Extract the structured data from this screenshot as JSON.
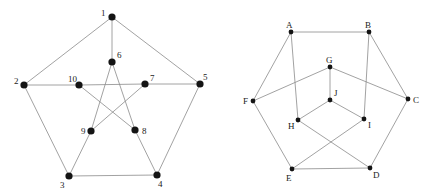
{
  "graphs": [
    {
      "name": "numbered-graph",
      "node_radius": 3.6,
      "nodes": [
        {
          "id": "1",
          "x": 112,
          "y": 17,
          "lx": 101,
          "ly": 16
        },
        {
          "id": "2",
          "x": 24,
          "y": 85,
          "lx": 14,
          "ly": 84
        },
        {
          "id": "3",
          "x": 69,
          "y": 176,
          "lx": 60,
          "ly": 188
        },
        {
          "id": "4",
          "x": 157,
          "y": 175,
          "lx": 158,
          "ly": 187
        },
        {
          "id": "5",
          "x": 200,
          "y": 84,
          "lx": 203,
          "ly": 80
        },
        {
          "id": "6",
          "x": 112,
          "y": 62,
          "lx": 117,
          "ly": 58
        },
        {
          "id": "7",
          "x": 145,
          "y": 84,
          "lx": 150,
          "ly": 81
        },
        {
          "id": "8",
          "x": 135,
          "y": 130,
          "lx": 142,
          "ly": 134
        },
        {
          "id": "9",
          "x": 91,
          "y": 131,
          "lx": 81,
          "ly": 134
        },
        {
          "id": "10",
          "x": 79,
          "y": 85,
          "lx": 68,
          "ly": 82
        }
      ],
      "edges": [
        [
          "1",
          "2"
        ],
        [
          "1",
          "5"
        ],
        [
          "1",
          "6"
        ],
        [
          "2",
          "10"
        ],
        [
          "10",
          "7"
        ],
        [
          "7",
          "5"
        ],
        [
          "2",
          "3"
        ],
        [
          "3",
          "4"
        ],
        [
          "4",
          "5"
        ],
        [
          "6",
          "9"
        ],
        [
          "6",
          "8"
        ],
        [
          "8",
          "4"
        ],
        [
          "9",
          "3"
        ],
        [
          "10",
          "8"
        ],
        [
          "7",
          "9"
        ]
      ]
    },
    {
      "name": "lettered-graph",
      "node_radius": 2.4,
      "nodes": [
        {
          "id": "A",
          "x": 291,
          "y": 32,
          "lx": 286,
          "ly": 28
        },
        {
          "id": "B",
          "x": 369,
          "y": 32,
          "lx": 365,
          "ly": 28
        },
        {
          "id": "C",
          "x": 408,
          "y": 99,
          "lx": 413,
          "ly": 103
        },
        {
          "id": "D",
          "x": 370,
          "y": 168,
          "lx": 373,
          "ly": 178
        },
        {
          "id": "E",
          "x": 292,
          "y": 169,
          "lx": 286,
          "ly": 181
        },
        {
          "id": "F",
          "x": 253,
          "y": 101,
          "lx": 243,
          "ly": 104
        },
        {
          "id": "G",
          "x": 330,
          "y": 67,
          "lx": 326,
          "ly": 63
        },
        {
          "id": "H",
          "x": 298,
          "y": 120,
          "lx": 288,
          "ly": 129
        },
        {
          "id": "I",
          "x": 364,
          "y": 119,
          "lx": 368,
          "ly": 128
        },
        {
          "id": "J",
          "x": 330,
          "y": 100,
          "lx": 334,
          "ly": 96
        }
      ],
      "edges": [
        [
          "A",
          "B"
        ],
        [
          "A",
          "F"
        ],
        [
          "A",
          "H"
        ],
        [
          "B",
          "C"
        ],
        [
          "B",
          "I"
        ],
        [
          "G",
          "F"
        ],
        [
          "G",
          "C"
        ],
        [
          "G",
          "J"
        ],
        [
          "J",
          "H"
        ],
        [
          "J",
          "I"
        ],
        [
          "F",
          "E"
        ],
        [
          "C",
          "D"
        ],
        [
          "H",
          "D"
        ],
        [
          "I",
          "E"
        ],
        [
          "E",
          "D"
        ]
      ]
    }
  ]
}
